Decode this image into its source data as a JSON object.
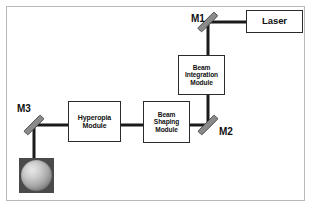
{
  "figure": {
    "background_color": "#ffffff",
    "frame_border_color": "#b9b9b9",
    "beam_color": "#1a1a1a",
    "box_border_color": "#2b2b2b",
    "text_color": "#111111",
    "mirror_fill_color": "#808080",
    "target_square_color": "#4a4a4a"
  },
  "boxes": {
    "laser": {
      "label": "Laser"
    },
    "beam_integration_module": {
      "line1": "Beam",
      "line2": "Integration",
      "line3": "Module"
    },
    "hyperopia_module": {
      "line1": "Hyperopia",
      "line2": "Module"
    },
    "beam_shaping_module": {
      "line1": "Beam",
      "line2": "Shaping",
      "line3": "Module"
    }
  },
  "mirrors": [
    {
      "id": "m1",
      "label": "M1"
    },
    {
      "id": "m2",
      "label": "M2"
    },
    {
      "id": "m3",
      "label": "M3"
    }
  ],
  "target": {
    "name": "eye-target",
    "shape": "sphere-in-square"
  },
  "beam_path": {
    "segments": [
      {
        "from": "laser",
        "to": "m1",
        "orientation": "horizontal"
      },
      {
        "from": "m1",
        "to": "beam_integration_module",
        "orientation": "vertical"
      },
      {
        "from": "beam_integration_module",
        "to": "m2",
        "orientation": "vertical"
      },
      {
        "from": "m2",
        "to": "beam_shaping_module",
        "orientation": "horizontal"
      },
      {
        "from": "beam_shaping_module",
        "to": "hyperopia_module",
        "orientation": "horizontal"
      },
      {
        "from": "hyperopia_module",
        "to": "m3",
        "orientation": "horizontal"
      },
      {
        "from": "m3",
        "to": "target",
        "orientation": "vertical"
      }
    ]
  }
}
